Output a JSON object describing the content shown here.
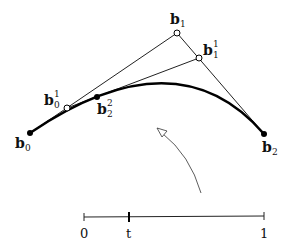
{
  "diagram": {
    "points": {
      "b0": {
        "base": "b",
        "sub": "0",
        "sup": ""
      },
      "b1": {
        "base": "b",
        "sub": "1",
        "sup": ""
      },
      "b2": {
        "base": "b",
        "sub": "2",
        "sup": ""
      },
      "b0_1": {
        "base": "b",
        "sub": "0",
        "sup": "1"
      },
      "b1_1": {
        "base": "b",
        "sub": "1",
        "sup": "1"
      },
      "b2_2": {
        "base": "b",
        "sub": "2",
        "sup": "2"
      }
    },
    "parameter_line": {
      "start_label": "0",
      "param_label": "t",
      "end_label": "1"
    }
  }
}
